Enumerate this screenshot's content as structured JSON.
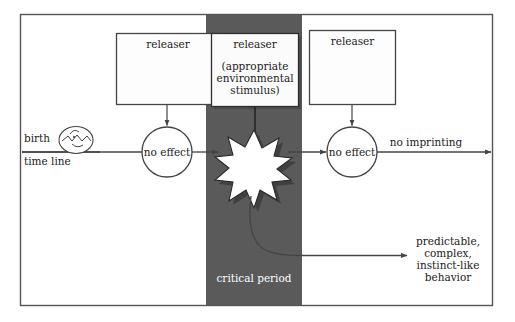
{
  "figure": {
    "title_visible": false,
    "background_color": "#ffffff",
    "frame_color": "#555555",
    "band_color": "#5a5a5a",
    "box_fill": "#fbfbfb",
    "line_color": "#444444"
  },
  "timeline": {
    "birth_label": "birth",
    "time_line_label": "time line",
    "egg_icon": "hatching-chick-icon"
  },
  "releasers": {
    "left": {
      "label": "releaser"
    },
    "center": {
      "label": "releaser",
      "sub_line_1": "(appropriate",
      "sub_line_2": "environmental",
      "sub_line_3": "stimulus)"
    },
    "right": {
      "label": "releaser"
    }
  },
  "nodes": {
    "left_effect": "no effect",
    "right_effect": "no effect",
    "burst_icon": "starburst-icon"
  },
  "band": {
    "label": "critical period"
  },
  "outcomes": {
    "no_imprinting": "no imprinting",
    "imprinting_line_1": "predictable,",
    "imprinting_line_2": "complex,",
    "imprinting_line_3": "instinct-like",
    "imprinting_line_4": "behavior"
  }
}
